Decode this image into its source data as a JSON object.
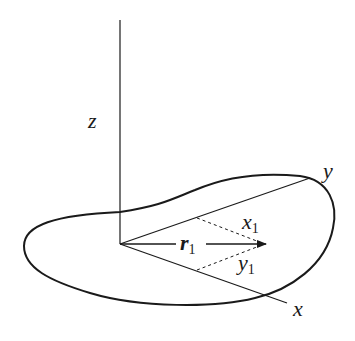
{
  "diagram": {
    "labels": {
      "z_axis": "z",
      "y_axis": "y",
      "x_axis": "x",
      "vector_main": "r",
      "vector_sub": "1",
      "x1_main": "x",
      "x1_sub": "1",
      "y1_main": "y",
      "y1_sub": "1"
    },
    "colors": {
      "stroke": "#1a1a1a",
      "background": "#ffffff"
    }
  }
}
